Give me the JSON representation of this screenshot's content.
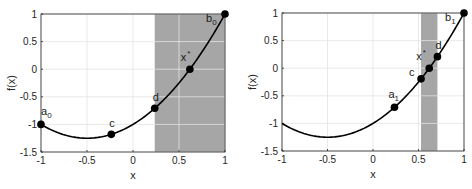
{
  "chart_data": [
    {
      "type": "line",
      "title": "",
      "xlabel": "x",
      "ylabel": "f(x)",
      "xlim": [
        -1,
        1
      ],
      "ylim": [
        -1.5,
        1
      ],
      "xticks": [
        -1,
        -0.5,
        0,
        0.5,
        1
      ],
      "xtick_labels": [
        "-1",
        "-0.5",
        "0",
        "0.5",
        "1"
      ],
      "yticks": [
        1,
        0.5,
        0,
        -0.5,
        -1,
        -1.5
      ],
      "ytick_labels": [
        "1",
        "0.5",
        "0",
        "-0.5",
        "-1",
        "-1.5"
      ],
      "grid": true,
      "function": "f(x) = x^2 + x - 1",
      "curve_x_range": [
        -1,
        1
      ],
      "shaded_region": {
        "x_from": 0.236,
        "x_to": 1.0,
        "color": "#a6a6a6"
      },
      "points": [
        {
          "label": "a",
          "sub": "0",
          "sup": "",
          "x": -1.0,
          "y": -1.0
        },
        {
          "label": "c",
          "sub": "",
          "sup": "",
          "x": -0.236,
          "y": -1.18
        },
        {
          "label": "d",
          "sub": "",
          "sup": "",
          "x": 0.236,
          "y": -0.708
        },
        {
          "label": "x",
          "sub": "",
          "sup": "*",
          "x": 0.618,
          "y": 0.0
        },
        {
          "label": "b",
          "sub": "0",
          "sup": "",
          "x": 1.0,
          "y": 1.0
        }
      ]
    },
    {
      "type": "line",
      "title": "",
      "xlabel": "x",
      "ylabel": "f(x)",
      "xlim": [
        -1,
        1
      ],
      "ylim": [
        -1.5,
        1
      ],
      "xticks": [
        -1,
        -0.5,
        0,
        0.5,
        1
      ],
      "xtick_labels": [
        "-1",
        "-0.5",
        "0",
        "0.5",
        "1"
      ],
      "yticks": [
        1,
        0.5,
        0,
        -0.5,
        -1,
        -1.5
      ],
      "ytick_labels": [
        "1",
        "0.5",
        "0",
        "-0.5",
        "-1",
        "-1.5"
      ],
      "grid": true,
      "function": "f(x) = x^2 + x - 1",
      "curve_x_range": [
        -1,
        1
      ],
      "shaded_region": {
        "x_from": 0.528,
        "x_to": 0.708,
        "color": "#a6a6a6"
      },
      "points": [
        {
          "label": "a",
          "sub": "1",
          "sup": "",
          "x": 0.236,
          "y": -0.708
        },
        {
          "label": "c",
          "sub": "",
          "sup": "",
          "x": 0.528,
          "y": -0.193
        },
        {
          "label": "x",
          "sub": "",
          "sup": "*",
          "x": 0.618,
          "y": 0.0
        },
        {
          "label": "d",
          "sub": "",
          "sup": "",
          "x": 0.708,
          "y": 0.209
        },
        {
          "label": "b",
          "sub": "1",
          "sup": "",
          "x": 1.0,
          "y": 1.0
        }
      ]
    }
  ]
}
